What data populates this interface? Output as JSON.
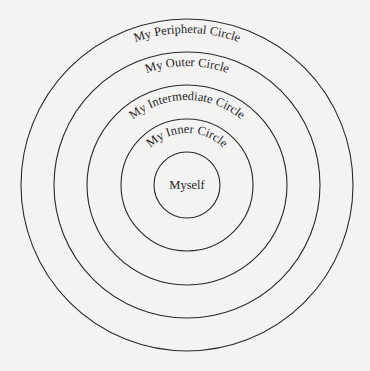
{
  "diagram": {
    "type": "concentric-circles",
    "center": {
      "x": 187,
      "y": 185
    },
    "colors": {
      "background": "#f3f3f2",
      "stroke": "#2a2a2a",
      "text": "#1e1e1e"
    },
    "center_label": "Myself",
    "rings": [
      {
        "label": "My Inner Circle",
        "radius": 66,
        "label_radius": 52
      },
      {
        "label": "My Intermediate Circle",
        "radius": 100,
        "label_radius": 85
      },
      {
        "label": "My Outer Circle",
        "radius": 133,
        "label_radius": 119
      },
      {
        "label": "My Peripheral Circle",
        "radius": 166,
        "label_radius": 152
      }
    ],
    "core_radius": 33
  }
}
